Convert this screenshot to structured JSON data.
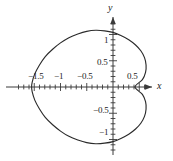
{
  "figure": {
    "kind": "polar-curve-plot",
    "background": "#ffffff",
    "curve_color": "#2b2b2b",
    "axis_color": "#3a3a3a"
  },
  "axes": {
    "x_name": "x",
    "y_name": "y",
    "x_name_style": "italic",
    "y_name_style": "italic",
    "x_range": [
      -1.85,
      0.95
    ],
    "y_range": [
      -1.35,
      1.35
    ],
    "minor_tick_step": 0.1,
    "major_tick_step": 0.5,
    "grid": false,
    "arrows": [
      "x-positive",
      "y-positive"
    ]
  },
  "x_tick_labels": [
    {
      "value": -1.5,
      "text": "−1.5"
    },
    {
      "value": -1.0,
      "text": "−1"
    },
    {
      "value": -0.5,
      "text": "−0.5"
    },
    {
      "value": 0.5,
      "text": "0.5"
    }
  ],
  "y_tick_labels": [
    {
      "value": 1.0,
      "text": "1"
    },
    {
      "value": 0.5,
      "text": "0.5"
    },
    {
      "value": -0.5,
      "text": "−0.5"
    },
    {
      "value": -1.0,
      "text": "−1"
    }
  ],
  "chart_data": {
    "type": "line",
    "title": "",
    "xlabel": "x",
    "ylabel": "y",
    "xlim": [
      -1.85,
      0.95
    ],
    "ylim": [
      -1.35,
      1.35
    ],
    "grid": false,
    "legend": null,
    "curve_name": "dimpled-limacon",
    "polar_equation": "r = 0.5 + cos(theta) (dimpled limacon, reflected)",
    "closed": true,
    "features": {
      "leftmost_x": -1.55,
      "rightmost_bulge_x": 0.63,
      "dimple_x_at_y0": 0.42,
      "top_y": 1.08,
      "bottom_y": -1.08
    },
    "points": [
      [
        0.42,
        0.0
      ],
      [
        0.56,
        0.14
      ],
      [
        0.62,
        0.28
      ],
      [
        0.63,
        0.42
      ],
      [
        0.6,
        0.56
      ],
      [
        0.53,
        0.69
      ],
      [
        0.43,
        0.8
      ],
      [
        0.3,
        0.9
      ],
      [
        0.15,
        0.98
      ],
      [
        0.0,
        1.04
      ],
      [
        -0.16,
        1.07
      ],
      [
        -0.33,
        1.08
      ],
      [
        -0.5,
        1.06
      ],
      [
        -0.67,
        1.01
      ],
      [
        -0.84,
        0.94
      ],
      [
        -1.0,
        0.84
      ],
      [
        -1.15,
        0.72
      ],
      [
        -1.29,
        0.58
      ],
      [
        -1.4,
        0.42
      ],
      [
        -1.49,
        0.25
      ],
      [
        -1.54,
        0.09
      ],
      [
        -1.55,
        0.0
      ],
      [
        -1.54,
        -0.09
      ],
      [
        -1.49,
        -0.25
      ],
      [
        -1.4,
        -0.42
      ],
      [
        -1.29,
        -0.58
      ],
      [
        -1.15,
        -0.72
      ],
      [
        -1.0,
        -0.84
      ],
      [
        -0.84,
        -0.94
      ],
      [
        -0.67,
        -1.01
      ],
      [
        -0.5,
        -1.06
      ],
      [
        -0.33,
        -1.08
      ],
      [
        -0.16,
        -1.07
      ],
      [
        0.0,
        -1.04
      ],
      [
        0.15,
        -0.98
      ],
      [
        0.3,
        -0.9
      ],
      [
        0.43,
        -0.8
      ],
      [
        0.53,
        -0.69
      ],
      [
        0.6,
        -0.56
      ],
      [
        0.63,
        -0.42
      ],
      [
        0.62,
        -0.28
      ],
      [
        0.56,
        -0.14
      ],
      [
        0.42,
        0.0
      ]
    ]
  }
}
